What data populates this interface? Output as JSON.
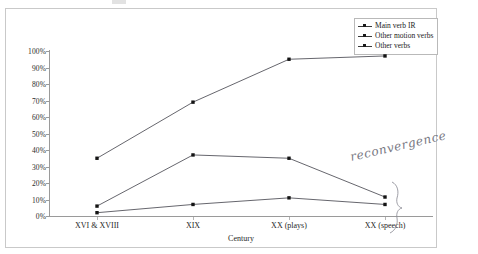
{
  "figure": {
    "annotation": {
      "text": "reconvergence",
      "kind": "handwritten-note"
    }
  },
  "legend": {
    "position": "top-right",
    "items": [
      {
        "label": "Main verb IR",
        "color": "#3a3a3a",
        "marker": "square"
      },
      {
        "label": "Other motion verbs",
        "color": "#3a3a3a",
        "marker": "square"
      },
      {
        "label": "Other verbs",
        "color": "#3a3a3a",
        "marker": "square"
      }
    ]
  },
  "chart_data": {
    "type": "line",
    "title": "",
    "xlabel": "Century",
    "ylabel": "",
    "categories": [
      "XVI & XVIII",
      "XIX",
      "XX (plays)",
      "XX (speech)"
    ],
    "series": [
      {
        "name": "Main verb IR",
        "values": [
          35,
          69,
          95,
          97
        ]
      },
      {
        "name": "Other motion verbs",
        "values": [
          6,
          37,
          35,
          11.5
        ]
      },
      {
        "name": "Other verbs",
        "values": [
          2,
          7,
          11,
          7
        ]
      }
    ],
    "ylim": [
      0,
      100
    ],
    "yticks": [
      0,
      10,
      20,
      30,
      40,
      50,
      60,
      70,
      80,
      90,
      100
    ],
    "ytick_labels": [
      "0%",
      "10%",
      "20%",
      "30%",
      "40%",
      "50%",
      "60%",
      "70%",
      "80%",
      "90%",
      "100%"
    ],
    "grid": false,
    "legend_position": "top-right",
    "annotations": [
      {
        "text": "reconvergence",
        "target": "XX (speech) convergence of Other motion verbs and Other verbs"
      }
    ]
  }
}
